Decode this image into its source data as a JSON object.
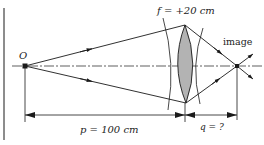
{
  "diagram": {
    "object_label": "O",
    "lens_label": "f = +20 cm",
    "image_label": "image",
    "p_label": "p = 100 cm",
    "q_label": "q = ?",
    "colors": {
      "line": "#1a1a1a",
      "lens_fill": "#b3b3b3",
      "background": "#ffffff"
    }
  }
}
